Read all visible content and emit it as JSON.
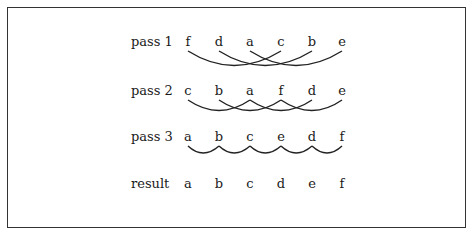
{
  "diagram": {
    "rows": [
      {
        "label": "pass 1",
        "letters": [
          "f",
          "d",
          "a",
          "c",
          "b",
          "e"
        ]
      },
      {
        "label": "pass 2",
        "letters": [
          "c",
          "b",
          "a",
          "f",
          "d",
          "e"
        ]
      },
      {
        "label": "pass 3",
        "letters": [
          "a",
          "b",
          "c",
          "e",
          "d",
          "f"
        ]
      },
      {
        "label": "result",
        "letters": [
          "a",
          "b",
          "c",
          "d",
          "e",
          "f"
        ]
      }
    ],
    "comparisons": {
      "pass 1": [
        [
          0,
          3
        ],
        [
          1,
          4
        ],
        [
          2,
          5
        ]
      ],
      "pass 2": [
        [
          0,
          2
        ],
        [
          1,
          3
        ],
        [
          2,
          4
        ],
        [
          3,
          5
        ]
      ],
      "pass 3": [
        [
          0,
          1
        ],
        [
          1,
          2
        ],
        [
          2,
          3
        ],
        [
          3,
          4
        ],
        [
          4,
          5
        ]
      ]
    }
  }
}
